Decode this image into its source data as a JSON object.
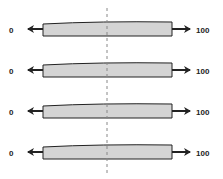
{
  "diagram": {
    "left_label": "0",
    "right_label": "100",
    "bar_fill": "#d4d4d4",
    "stroke": "#222222",
    "midline_color": "#888888",
    "rows": [
      {
        "left": "0",
        "right": "100",
        "y": 22
      },
      {
        "left": "0",
        "right": "100",
        "y": 63
      },
      {
        "left": "0",
        "right": "100",
        "y": 104
      },
      {
        "left": "0",
        "right": "100",
        "y": 145
      }
    ]
  }
}
